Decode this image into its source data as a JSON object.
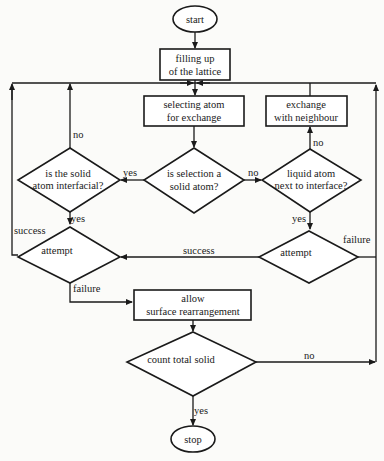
{
  "diagram": {
    "type": "flowchart",
    "nodes": {
      "start": {
        "label": "start",
        "shape": "ellipse"
      },
      "fill": {
        "line1": "filling up",
        "line2": "of the lattice",
        "shape": "rect"
      },
      "select": {
        "line1": "selecting atom",
        "line2": "for exchange",
        "shape": "rect"
      },
      "exchange": {
        "line1": "exchange",
        "line2": "with neighbour",
        "shape": "rect"
      },
      "interfacial": {
        "line1": "is the solid",
        "line2": "atom interfacial?",
        "shape": "diamond"
      },
      "is_solid": {
        "line1": "is selection a",
        "line2": "solid atom?",
        "shape": "diamond"
      },
      "liquid": {
        "line1": "liquid atom",
        "line2": "next to interface?",
        "shape": "diamond"
      },
      "attempt_left": {
        "label": "attempt",
        "shape": "diamond"
      },
      "attempt_right": {
        "label": "attempt",
        "shape": "diamond"
      },
      "rearrange": {
        "line1": "allow",
        "line2": "surface rearrangement",
        "shape": "rect"
      },
      "count": {
        "label": "count total solid",
        "shape": "diamond"
      },
      "stop": {
        "label": "stop",
        "shape": "ellipse"
      }
    },
    "edge_labels": {
      "interfacial_no": "no",
      "interfacial_yes": "yes",
      "is_solid_yes": "yes",
      "is_solid_no": "no",
      "liquid_no": "no",
      "liquid_yes": "yes",
      "attempt_left_success": "success",
      "attempt_left_failure": "failure",
      "attempt_right_success": "success",
      "attempt_right_failure": "failure",
      "count_no": "no",
      "count_yes": "yes"
    },
    "edges": [
      [
        "start",
        "fill",
        ""
      ],
      [
        "fill",
        "select",
        ""
      ],
      [
        "select",
        "is_solid",
        ""
      ],
      [
        "is_solid",
        "interfacial",
        "yes"
      ],
      [
        "is_solid",
        "liquid",
        "no"
      ],
      [
        "interfacial",
        "select",
        "no"
      ],
      [
        "interfacial",
        "attempt_left",
        "yes"
      ],
      [
        "liquid",
        "exchange",
        "no"
      ],
      [
        "liquid",
        "attempt_right",
        "yes"
      ],
      [
        "exchange",
        "select",
        ""
      ],
      [
        "attempt_right",
        "attempt_left",
        "success"
      ],
      [
        "attempt_right",
        "select",
        "failure"
      ],
      [
        "attempt_left",
        "select",
        "success"
      ],
      [
        "attempt_left",
        "rearrange",
        "failure"
      ],
      [
        "rearrange",
        "count",
        ""
      ],
      [
        "count",
        "select",
        "no"
      ],
      [
        "count",
        "stop",
        "yes"
      ]
    ]
  }
}
